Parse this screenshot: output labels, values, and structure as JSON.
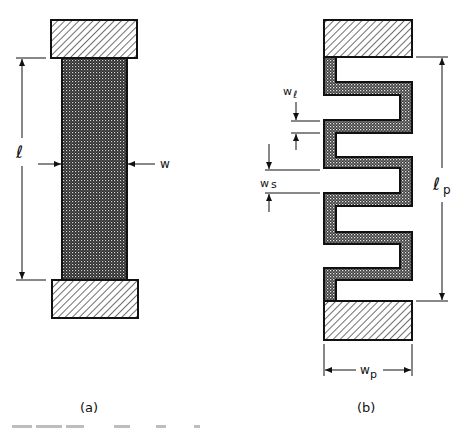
{
  "figure": {
    "panel_a": {
      "label": "(a)",
      "length_symbol": "ℓ",
      "width_symbol": "w",
      "description": "Straight strip between two contact pads"
    },
    "panel_b": {
      "label": "(b)",
      "length_symbol": "ℓ",
      "length_subscript": "p",
      "width_symbol": "w",
      "width_subscript": "p",
      "line_width_symbol": "w",
      "line_width_subscript": "ℓ",
      "spacing_symbol": "w",
      "spacing_subscript": "s",
      "description": "Serpentine (meander) strip between two contact pads"
    },
    "caption_visible": "Fig. — (faint, illegible caption text)"
  },
  "colors": {
    "ink": "#111111",
    "pad_hatch": "#222222",
    "strip_fill": "#3a3a3a",
    "caption": "#bdbdbd"
  }
}
